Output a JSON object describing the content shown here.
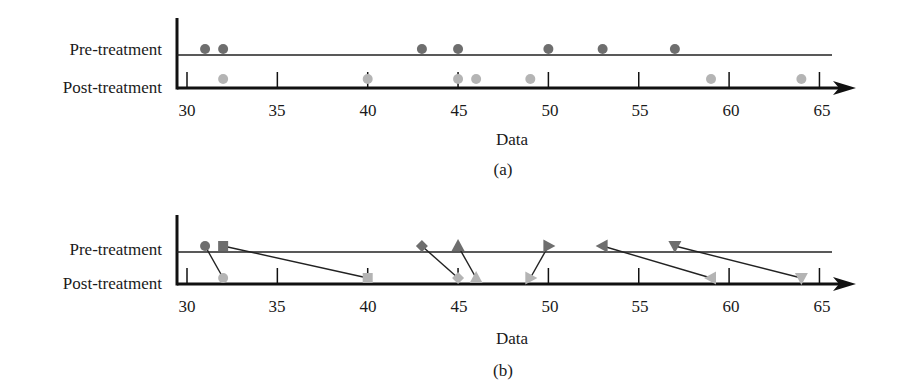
{
  "figure": {
    "panels": [
      {
        "id": "a",
        "caption": "(a)",
        "xlabel": "Data",
        "row_labels": {
          "pre": "Pre-treatment",
          "post": "Post-treatment"
        }
      },
      {
        "id": "b",
        "caption": "(b)",
        "xlabel": "Data",
        "row_labels": {
          "pre": "Pre-treatment",
          "post": "Post-treatment"
        }
      }
    ],
    "ticks": [
      "30",
      "35",
      "40",
      "45",
      "50",
      "55",
      "60",
      "65"
    ],
    "colors": {
      "pre": "#6e6e6e",
      "post": "#b4b4b4",
      "axis": "#111111",
      "line": "#222222"
    }
  },
  "chart_data": [
    {
      "type": "scatter",
      "title": "(a)",
      "xlabel": "Data",
      "ylabel": "",
      "categories": [
        "Pre-treatment",
        "Post-treatment"
      ],
      "xlim": [
        30,
        65
      ],
      "xticks": [
        30,
        35,
        40,
        45,
        50,
        55,
        60,
        65
      ],
      "grid": false,
      "series": [
        {
          "name": "Pre-treatment",
          "marker": "circle",
          "values": [
            31,
            32,
            43,
            45,
            50,
            53,
            57
          ]
        },
        {
          "name": "Post-treatment",
          "marker": "circle",
          "values": [
            32,
            40,
            45,
            46,
            49,
            59,
            64
          ]
        }
      ]
    },
    {
      "type": "scatter",
      "title": "(b)",
      "xlabel": "Data",
      "ylabel": "",
      "categories": [
        "Pre-treatment",
        "Post-treatment"
      ],
      "xlim": [
        30,
        65
      ],
      "xticks": [
        30,
        35,
        40,
        45,
        50,
        55,
        60,
        65
      ],
      "grid": false,
      "paired": true,
      "pairs": [
        {
          "subject": 1,
          "marker": "circle",
          "pre": 31,
          "post": 32
        },
        {
          "subject": 2,
          "marker": "square",
          "pre": 32,
          "post": 40
        },
        {
          "subject": 3,
          "marker": "diamond",
          "pre": 43,
          "post": 45
        },
        {
          "subject": 4,
          "marker": "triangle-up",
          "pre": 45,
          "post": 46
        },
        {
          "subject": 5,
          "marker": "triangle-right",
          "pre": 50,
          "post": 49
        },
        {
          "subject": 6,
          "marker": "triangle-left",
          "pre": 53,
          "post": 59
        },
        {
          "subject": 7,
          "marker": "triangle-down",
          "pre": 57,
          "post": 64
        }
      ]
    }
  ]
}
